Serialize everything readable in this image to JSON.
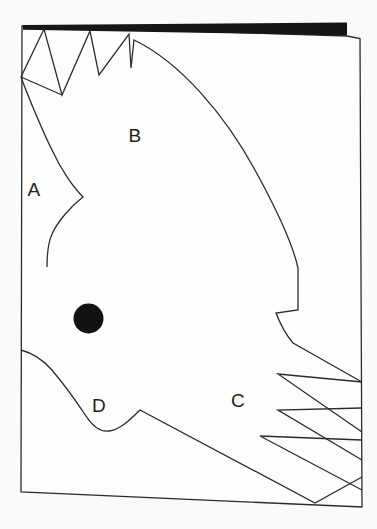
{
  "figure": {
    "kind": "line-drawing diagram of a paper-cutout flying bird on a book page",
    "region_labels": [
      {
        "letter": "A"
      },
      {
        "letter": "B"
      },
      {
        "letter": "C"
      },
      {
        "letter": "D"
      }
    ],
    "eye_dot": {
      "shape": "filled-circle",
      "color": "#121212"
    },
    "colors": {
      "outline": "#2b2b2b",
      "page_fill": "#fdfdfc",
      "background": "#fafaf8",
      "top_edge_bar": "#161616"
    }
  }
}
